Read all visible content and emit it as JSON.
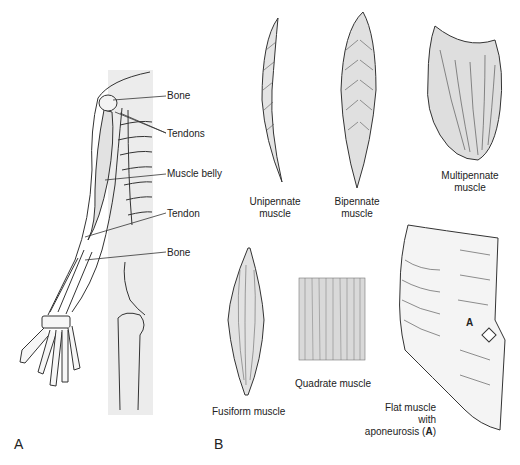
{
  "panels": {
    "a": {
      "letter": "A"
    },
    "b": {
      "letter": "B"
    }
  },
  "arm_labels": {
    "bone_top": "Bone",
    "tendons": "Tendons",
    "muscle_belly": "Muscle belly",
    "tendon": "Tendon",
    "bone_bottom": "Bone"
  },
  "muscle_types": {
    "unipennate": {
      "line1": "Unipennate",
      "line2": "muscle"
    },
    "bipennate": {
      "line1": "Bipennate",
      "line2": "muscle"
    },
    "multipennate": {
      "line1": "Multipennate",
      "line2": "muscle"
    },
    "fusiform": {
      "label": "Fusiform muscle"
    },
    "quadrate": {
      "label": "Quadrate muscle"
    },
    "flat": {
      "line1": "Flat muscle",
      "line2": "with",
      "line3_prefix": "aponeurosis (",
      "line3_bold": "A",
      "line3_suffix": ")",
      "marker": "A"
    }
  },
  "colors": {
    "line": "#333333",
    "shade": "#d8d8d8",
    "bg_strip": "#eeeeee"
  }
}
